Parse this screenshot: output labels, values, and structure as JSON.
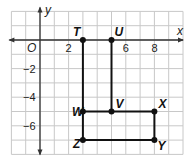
{
  "axes": {
    "x_label": "x",
    "y_label": "y",
    "origin_label": "O",
    "x_ticks": [
      {
        "v": 2,
        "label": "2"
      },
      {
        "v": 6,
        "label": "6"
      },
      {
        "v": 8,
        "label": "8"
      }
    ],
    "y_ticks": [
      {
        "v": -2,
        "label": "−2"
      },
      {
        "v": -4,
        "label": "−4"
      },
      {
        "v": -6,
        "label": "−6"
      }
    ],
    "x_range": [
      -2,
      10
    ],
    "y_range": [
      -8,
      2
    ]
  },
  "points": [
    {
      "name": "T",
      "x": 3,
      "y": 0
    },
    {
      "name": "U",
      "x": 5,
      "y": 0
    },
    {
      "name": "V",
      "x": 5,
      "y": -5
    },
    {
      "name": "W",
      "x": 3,
      "y": -5
    },
    {
      "name": "X",
      "x": 8,
      "y": -5
    },
    {
      "name": "Y",
      "x": 8,
      "y": -7
    },
    {
      "name": "Z",
      "x": 3,
      "y": -7
    }
  ],
  "segments": [
    [
      "T",
      "W"
    ],
    [
      "W",
      "Z"
    ],
    [
      "U",
      "V"
    ],
    [
      "W",
      "X"
    ],
    [
      "X",
      "Y"
    ],
    [
      "Z",
      "Y"
    ]
  ],
  "colors": {
    "grid": "#c8c8c8",
    "axis": "#333333",
    "figure": "#111111"
  }
}
